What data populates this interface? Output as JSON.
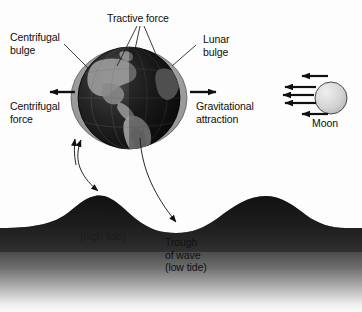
{
  "figure": {
    "background_color": "#fdfdfd",
    "width": 362,
    "height": 312
  },
  "labels": {
    "tractive_force": "Tractive force",
    "centrifugal_bulge": "Centrifugal\nbulge",
    "centrifugal_force": "Centrifugal\nforce",
    "lunar_bulge": "Lunar\nbulge",
    "gravitational_attraction": "Gravitational\nattraction",
    "moon": "Moon",
    "crest_of_wave": "Crest\nof wave\n(high tide)",
    "trough_of_wave": "Trough\nof wave\n(low tide)"
  },
  "label_lines": {
    "centrifugal_bulge_l1": "Centrifugal",
    "centrifugal_bulge_l2": "bulge",
    "centrifugal_force_l1": "Centrifugal",
    "centrifugal_force_l2": "force",
    "lunar_bulge_l1": "Lunar",
    "lunar_bulge_l2": "bulge",
    "gravitational_l1": "Gravitational",
    "gravitational_l2": "attraction",
    "crest_l1": "Crest",
    "crest_l2": "of wave",
    "crest_l3": "(high tide)",
    "trough_l1": "Trough",
    "trough_l2": "of wave",
    "trough_l3": "(low tide)"
  },
  "objects": {
    "earth": {
      "name": "Earth",
      "center_x": 129,
      "center_y": 98,
      "radius": 51,
      "body_color": "#1c1c1c",
      "land_color": "#8f8f8f",
      "bulge_color": "#a0a0a0",
      "bulge_rx": 58,
      "bulge_ry": 50
    },
    "moon": {
      "name": "Moon",
      "center_x": 331,
      "center_y": 98,
      "radius": 16,
      "color": "#d2d2d2",
      "outline_color": "#4a4a4a"
    },
    "water": {
      "name": "Tidal wave water body",
      "crest1_x": 95,
      "crest2_x": 266,
      "trough_x": 176,
      "surface_baseline_y": 228,
      "crest_peak_y": 196,
      "trough_y": 232,
      "dark_color": "#1f1f1f",
      "fade_color": "#fbfbfb"
    }
  },
  "arrows": {
    "centrifugal_force": {
      "direction": "left",
      "x1": 75,
      "x2": 48,
      "y": 92
    },
    "gravitational_attraction": {
      "direction": "right",
      "x1": 190,
      "x2": 218,
      "y": 92
    },
    "moon_pull": {
      "direction": "left",
      "count": 5,
      "rows_y": [
        80,
        88,
        96,
        104,
        112
      ]
    },
    "tractive_leaders": {
      "count": 3
    },
    "crest_link": {
      "type": "double-headed-curve"
    },
    "trough_link": {
      "type": "single-headed-curve"
    },
    "bulge_pointer": {
      "direction": "up"
    }
  },
  "colors": {
    "ink": "#0d0d0d",
    "line": "#222222",
    "background": "#fdfdfd"
  }
}
